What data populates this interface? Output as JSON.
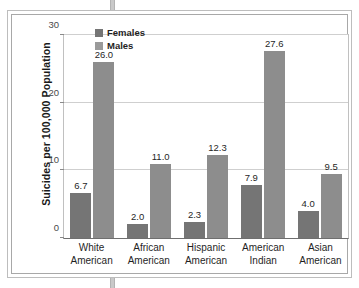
{
  "chart_data": {
    "type": "bar",
    "title": "",
    "subtitle": "",
    "xlabel": "",
    "ylabel": "Suicides per 100,000 Population",
    "ylim": [
      0,
      30
    ],
    "yticks": [
      0,
      10,
      20,
      30
    ],
    "ytick_labels": [
      "0",
      "10",
      "20",
      "30"
    ],
    "grid": true,
    "legend_position": "top-center",
    "categories": [
      "White American",
      "African American",
      "Hispanic American",
      "American Indian",
      "Asian American"
    ],
    "category_lines": [
      [
        "White",
        "American"
      ],
      [
        "African",
        "American"
      ],
      [
        "Hispanic",
        "American"
      ],
      [
        "American",
        "Indian"
      ],
      [
        "Asian",
        "American"
      ]
    ],
    "series": [
      {
        "name": "Females",
        "color": "#757575",
        "values": [
          6.7,
          2.0,
          2.3,
          7.9,
          4.0
        ],
        "value_labels": [
          "6.7",
          "2.0",
          "2.3",
          "7.9",
          "4.0"
        ]
      },
      {
        "name": "Males",
        "color": "#8d8d8d",
        "values": [
          26.0,
          11.0,
          12.3,
          27.6,
          9.5
        ],
        "value_labels": [
          "26.0",
          "11.0",
          "12.3",
          "27.6",
          "9.5"
        ]
      }
    ]
  },
  "legend": {
    "items": [
      {
        "label": "Females"
      },
      {
        "label": "Males"
      }
    ]
  },
  "colors": {
    "females": "#757575",
    "males": "#8d8d8d",
    "grid": "#cfcfcf",
    "axis": "#6f6f6f",
    "text": "#1f1f1f"
  }
}
